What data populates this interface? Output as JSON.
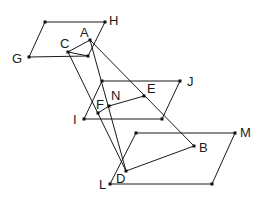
{
  "diagram": {
    "colors": {
      "stroke": "#1a1a1a",
      "point": "#111111",
      "background": "#ffffff"
    },
    "labels": {
      "A": "A",
      "B": "B",
      "C": "C",
      "D": "D",
      "E": "E",
      "F": "F",
      "G": "G",
      "H": "H",
      "I": "I",
      "J": "J",
      "L": "L",
      "M": "M",
      "N": "N"
    },
    "parallelograms": [
      {
        "name": "GH",
        "vertices": [
          "G",
          "P1",
          "H",
          "P2"
        ]
      },
      {
        "name": "IJ",
        "vertices": [
          "I",
          "P3",
          "J",
          "P4"
        ]
      },
      {
        "name": "LM",
        "vertices": [
          "L",
          "P5",
          "M",
          "P6"
        ]
      }
    ],
    "segments": [
      [
        "A",
        "B"
      ],
      [
        "A",
        "D"
      ],
      [
        "C",
        "D"
      ],
      [
        "C",
        "A"
      ],
      [
        "C",
        "P2"
      ],
      [
        "F",
        "N"
      ],
      [
        "N",
        "E"
      ],
      [
        "D",
        "B"
      ]
    ]
  }
}
